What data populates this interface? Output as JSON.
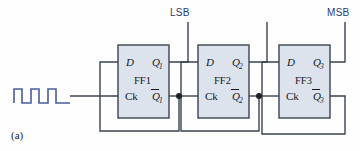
{
  "figure": {
    "caption": "(a)",
    "accent_color": "#2b3a72",
    "box_fill": "#dce3ec",
    "wire_color": "#3b4350",
    "clock_color": "#4a5d9e"
  },
  "bit_labels": [
    {
      "name": "lsb-label",
      "text": "LSB",
      "x": 170,
      "y": 16
    },
    {
      "name": "msb-label",
      "text": "MSB",
      "x": 327,
      "y": 16
    }
  ],
  "flipflops": [
    {
      "id": "ff1",
      "name": "FF1",
      "d_label": "D",
      "ck_label": "Ck",
      "q_label": "Q",
      "q_sub": "1",
      "qbar_label": "Q",
      "qbar_sub": "1",
      "box": {
        "x": 118,
        "y": 45,
        "w": 51,
        "h": 73
      }
    },
    {
      "id": "ff2",
      "name": "FF2",
      "d_label": "D",
      "ck_label": "Ck",
      "q_label": "Q",
      "q_sub": "2",
      "qbar_label": "Q",
      "qbar_sub": "2",
      "box": {
        "x": 198,
        "y": 45,
        "w": 51,
        "h": 73
      }
    },
    {
      "id": "ff3",
      "name": "FF3",
      "d_label": "D",
      "ck_label": "Ck",
      "q_label": "Q",
      "q_sub": "3",
      "qbar_label": "Q",
      "qbar_sub": "3",
      "box": {
        "x": 279,
        "y": 45,
        "w": 51,
        "h": 73
      }
    }
  ],
  "clock_input": {
    "name": "clock-waveform",
    "pulses": 3,
    "description": "square wave pulse train input"
  },
  "junctions": [
    {
      "name": "junction-q1bar",
      "x": 179,
      "y": 96
    },
    {
      "name": "junction-q2bar",
      "x": 259,
      "y": 96
    }
  ],
  "outputs": [
    {
      "name": "q1-output-tap",
      "bit": "LSB"
    },
    {
      "name": "q2-output-tap",
      "bit": ""
    },
    {
      "name": "q3-output-tap",
      "bit": "MSB"
    }
  ]
}
